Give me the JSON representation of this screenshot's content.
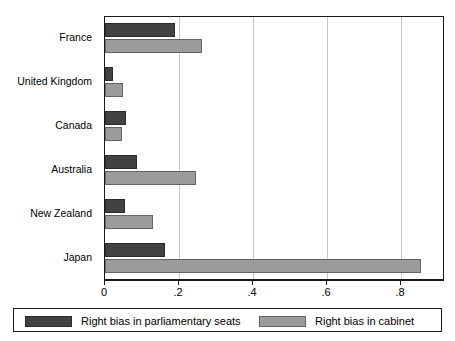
{
  "chart_data": {
    "type": "bar",
    "orientation": "horizontal",
    "title": "",
    "xlabel": "",
    "ylabel": "",
    "xlim": [
      0,
      0.919
    ],
    "xticks": [
      0,
      0.2,
      0.4,
      0.6,
      0.8
    ],
    "xtick_labels": [
      "0",
      ".2",
      ".4",
      ".6",
      ".8"
    ],
    "grid": "vertical",
    "legend_position": "bottom",
    "categories": [
      "France",
      "United Kingdom",
      "Canada",
      "Australia",
      "New Zealand",
      "Japan"
    ],
    "series": [
      {
        "name": "Right bias in parliamentary seats",
        "color": "#424242",
        "values": [
          0.19,
          0.022,
          0.056,
          0.086,
          0.055,
          0.162
        ]
      },
      {
        "name": "Right bias in cabinet",
        "color": "#9b9b9b",
        "values": [
          0.262,
          0.048,
          0.047,
          0.245,
          0.129,
          0.855
        ]
      }
    ]
  },
  "axis": {
    "tick_0": "0",
    "tick_1": ".2",
    "tick_2": ".4",
    "tick_3": ".6",
    "tick_4": ".8"
  },
  "categories": {
    "c0": "France",
    "c1": "United Kingdom",
    "c2": "Canada",
    "c3": "Australia",
    "c4": "New Zealand",
    "c5": "Japan"
  },
  "legend": {
    "items": [
      {
        "label": "Right bias in parliamentary seats",
        "color": "#424242"
      },
      {
        "label": "Right bias in cabinet",
        "color": "#9b9b9b"
      }
    ]
  },
  "colors": {
    "seats": "#424242",
    "cabinet": "#9b9b9b",
    "grid": "#c9c9c9",
    "axis": "#1a1a1a",
    "background": "#ffffff"
  }
}
